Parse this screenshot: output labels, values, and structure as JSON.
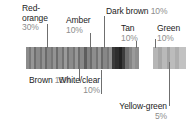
{
  "figure": {
    "type": "segmented-color-bar-callout",
    "title": "",
    "background": "#ffffff",
    "strip_y": 47,
    "strip_height": 22
  },
  "callouts": [
    {
      "name": "red-orange",
      "label": "Red-\norange",
      "label_line1": "Red-",
      "label_line2": "orange",
      "percent": "30%",
      "x": 22,
      "y": 6,
      "align": "left",
      "pct_below": true
    },
    {
      "name": "amber",
      "label_line1": "Amber",
      "label_line2": "",
      "percent": "10%",
      "x": 66,
      "y": 17,
      "align": "left",
      "pct_below": true
    },
    {
      "name": "dark-brown",
      "label_line1": "Dark brown",
      "label_line2": "",
      "percent": "10%",
      "x": 106,
      "y": 8,
      "align": "inline",
      "pct_below": false
    },
    {
      "name": "tan",
      "label_line1": "Tan",
      "label_line2": "",
      "percent": "10%",
      "x": 120,
      "y": 25,
      "align": "left",
      "pct_below": true
    },
    {
      "name": "green",
      "label_line1": "Green",
      "label_line2": "",
      "percent": "10%",
      "x": 155,
      "y": 25,
      "align": "left",
      "pct_below": true
    },
    {
      "name": "brown",
      "label_line1": "Brown",
      "label_line2": "",
      "percent": "15%",
      "x": 31,
      "y": 78,
      "align": "inline",
      "pct_below": false
    },
    {
      "name": "white-clear",
      "label_line1": "White/clear",
      "label_line2": "",
      "percent": "10%",
      "x": 90,
      "y": 77,
      "align": "right",
      "pct_below": true
    },
    {
      "name": "yellow-green",
      "label_line1": "Yellow-green",
      "label_line2": "",
      "percent": "5%",
      "x": 110,
      "y": 104,
      "align": "right",
      "pct_below": true
    }
  ],
  "chart_data": {
    "type": "bar",
    "categories": [
      "Red-orange",
      "Brown",
      "Amber",
      "Dark brown",
      "Tan",
      "White/clear",
      "Green",
      "Yellow-green"
    ],
    "values": [
      30,
      15,
      10,
      10,
      10,
      10,
      10,
      5
    ],
    "unit": "%",
    "xlabel": "",
    "ylabel": "",
    "legend": "callout labels",
    "grid": false
  },
  "strip_left": {
    "left": 26,
    "width": 116,
    "segments": [
      {
        "w": 3,
        "c": "#8c8c8c"
      },
      {
        "w": 2,
        "c": "#787878"
      },
      {
        "w": 3,
        "c": "#969696"
      },
      {
        "w": 2,
        "c": "#6e6e6e"
      },
      {
        "w": 4,
        "c": "#8a8a8a"
      },
      {
        "w": 2,
        "c": "#747474"
      },
      {
        "w": 3,
        "c": "#919191"
      },
      {
        "w": 2,
        "c": "#6a6a6a"
      },
      {
        "w": 4,
        "c": "#888888"
      },
      {
        "w": 2,
        "c": "#767676"
      },
      {
        "w": 3,
        "c": "#939393"
      },
      {
        "w": 2,
        "c": "#6c6c6c"
      },
      {
        "w": 4,
        "c": "#8e8e8e"
      },
      {
        "w": 2,
        "c": "#727272"
      },
      {
        "w": 3,
        "c": "#9a9a9a"
      },
      {
        "w": 2,
        "c": "#707070"
      },
      {
        "w": 4,
        "c": "#8b8b8b"
      },
      {
        "w": 2,
        "c": "#757575"
      },
      {
        "w": 3,
        "c": "#979797"
      },
      {
        "w": 2,
        "c": "#6d6d6d"
      },
      {
        "w": 4,
        "c": "#898989"
      },
      {
        "w": 3,
        "c": "#5e5e5e"
      },
      {
        "w": 3,
        "c": "#848484"
      },
      {
        "w": 2,
        "c": "#6b6b6b"
      },
      {
        "w": 4,
        "c": "#8d8d8d"
      },
      {
        "w": 2,
        "c": "#737373"
      },
      {
        "w": 3,
        "c": "#959595"
      },
      {
        "w": 2,
        "c": "#696969"
      },
      {
        "w": 4,
        "c": "#878787"
      },
      {
        "w": 2,
        "c": "#777777"
      },
      {
        "w": 3,
        "c": "#929292"
      },
      {
        "w": 3,
        "c": "#3a3a3a"
      },
      {
        "w": 4,
        "c": "#2e2e2e"
      },
      {
        "w": 3,
        "c": "#222222"
      },
      {
        "w": 3,
        "c": "#3d3d3d"
      },
      {
        "w": 4,
        "c": "#6f6f6f"
      },
      {
        "w": 3,
        "c": "#858585"
      },
      {
        "w": 3,
        "c": "#9b9b9b"
      },
      {
        "w": 4,
        "c": "#8f8f8f"
      }
    ]
  },
  "strip_right": {
    "left": 153,
    "width": 33,
    "segments": [
      {
        "w": 5,
        "c": "#b6b6b6"
      },
      {
        "w": 4,
        "c": "#a7a7a7"
      },
      {
        "w": 5,
        "c": "#b9b9b9"
      },
      {
        "w": 3,
        "c": "#a2a2a2"
      },
      {
        "w": 5,
        "c": "#bcbcbc"
      },
      {
        "w": 4,
        "c": "#aeaeae"
      },
      {
        "w": 7,
        "c": "#c2c2c2"
      }
    ]
  },
  "leaders": [
    {
      "name": "leader-red-orange",
      "x": 47,
      "y": 24,
      "h": 24
    },
    {
      "name": "leader-amber",
      "x": 90,
      "y": 33,
      "h": 15
    },
    {
      "name": "leader-dark-brown",
      "x": 104,
      "y": 16,
      "h": 32
    },
    {
      "name": "leader-tan",
      "x": 136,
      "y": 41,
      "h": 7
    },
    {
      "name": "leader-green",
      "x": 155,
      "y": 39,
      "h": 9
    },
    {
      "name": "leader-brown",
      "x": 79,
      "y": 69,
      "h": 12
    },
    {
      "name": "leader-white-clear",
      "x": 101,
      "y": 69,
      "h": 8
    },
    {
      "name": "leader-yellow-green",
      "x": 134,
      "y": 69,
      "h": 38
    },
    {
      "name": "leader-white-clear-stem",
      "x": 134,
      "y": 69,
      "h": 28
    }
  ]
}
